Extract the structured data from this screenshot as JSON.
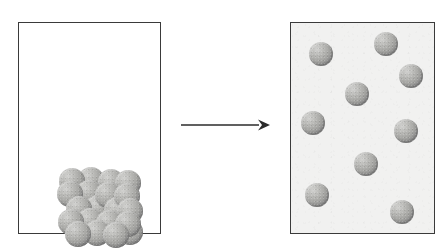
{
  "diagram": {
    "arrow": {
      "name": "reaction-arrow",
      "direction": "right",
      "label": "",
      "color": "#2b2b2b"
    },
    "colors": {
      "page_background": "#ffffff",
      "box_border": "#3a3a3a",
      "solid_box_fill": "#ffffff",
      "gas_box_fill": "#f1f1f0",
      "sphere_light": "#d2d2d0",
      "sphere_mid": "#a6a6a3",
      "sphere_dark": "#6e6e6c"
    },
    "panels": [
      {
        "id": "solid-box",
        "label": "",
        "state": "solid",
        "particle_count": 18,
        "arrangement": "close-packed ordered lattice settled at bottom of container",
        "x": 18,
        "y": 22,
        "width": 143,
        "height": 212
      },
      {
        "id": "gas-box",
        "label": "",
        "state": "gas",
        "particle_count": 9,
        "arrangement": "widely spaced particles dispersed throughout container",
        "x": 290,
        "y": 22,
        "width": 145,
        "height": 212
      }
    ],
    "solid_particles": [
      {
        "x": 2,
        "y": 1,
        "z": 3
      },
      {
        "x": 21,
        "y": 0,
        "z": 3
      },
      {
        "x": 41,
        "y": 2,
        "z": 3
      },
      {
        "x": 58,
        "y": 3,
        "z": 2
      },
      {
        "x": 0,
        "y": 14,
        "z": 2
      },
      {
        "x": 19,
        "y": 13,
        "z": 2
      },
      {
        "x": 38,
        "y": 15,
        "z": 2
      },
      {
        "x": 57,
        "y": 16,
        "z": 2
      },
      {
        "x": 9,
        "y": 29,
        "z": 1
      },
      {
        "x": 28,
        "y": 28,
        "z": 1
      },
      {
        "x": 47,
        "y": 30,
        "z": 1
      },
      {
        "x": 60,
        "y": 31,
        "z": 1
      },
      {
        "x": 1,
        "y": 42,
        "z": 1
      },
      {
        "x": 20,
        "y": 41,
        "z": 1
      },
      {
        "x": 39,
        "y": 43,
        "z": 1
      },
      {
        "x": 58,
        "y": 44,
        "z": 1
      },
      {
        "x": 8,
        "y": 54,
        "z": 0
      },
      {
        "x": 27,
        "y": 53,
        "z": 0
      },
      {
        "x": 46,
        "y": 55,
        "z": 0
      },
      {
        "x": 60,
        "y": 52,
        "z": 0
      }
    ],
    "gas_particles": [
      {
        "x": 18,
        "y": 19
      },
      {
        "x": 83,
        "y": 9
      },
      {
        "x": 108,
        "y": 41
      },
      {
        "x": 54,
        "y": 59
      },
      {
        "x": 10,
        "y": 88
      },
      {
        "x": 103,
        "y": 96
      },
      {
        "x": 63,
        "y": 129
      },
      {
        "x": 14,
        "y": 160
      },
      {
        "x": 99,
        "y": 177
      }
    ]
  }
}
